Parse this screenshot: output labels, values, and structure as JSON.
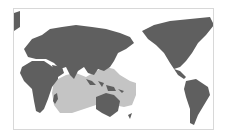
{
  "map": {
    "projection": "pacific-centered world map",
    "colors": {
      "land": "#5f5f5f",
      "range": "#c4c4c4",
      "ocean": "#ffffff",
      "border": "#d8d8d8"
    },
    "layers": [
      {
        "name": "land",
        "label": ""
      },
      {
        "name": "distribution-range",
        "label": ""
      }
    ]
  }
}
